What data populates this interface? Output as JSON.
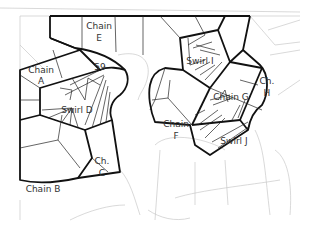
{
  "diagram": {
    "type": "pattern-region-map",
    "line_colors": {
      "primary": "#111111",
      "secondary": "#222222",
      "background": "#c8c8c8"
    },
    "labels": {
      "chain_e": {
        "line1": "Chain",
        "line2": "E"
      },
      "num_59": "59",
      "chain_a": {
        "line1": "Chain",
        "line2": "A"
      },
      "swirl_d": "Swirl D",
      "ch_c": {
        "line1": "Ch.",
        "line2": "C"
      },
      "chain_b": "Chain B",
      "swirl_i": "Swirl I",
      "chain_g": "Chain G",
      "ch_h": {
        "line1": "Ch.",
        "line2": "H"
      },
      "chain_f": {
        "line1": "Chain",
        "line2": "F"
      },
      "swirl_j": "Swirl J"
    }
  }
}
